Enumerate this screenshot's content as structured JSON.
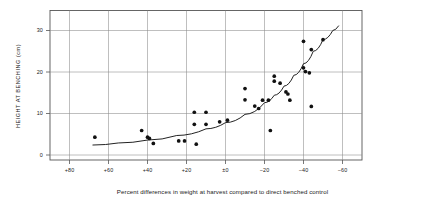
{
  "chart_data": {
    "type": "scatter",
    "title": "",
    "subtitle": "",
    "xlabel": "Percent differences in weight at harvest compared to direct benched control",
    "ylabel": "HEIGHT AT BENCHING (cm)",
    "grid": true,
    "legend": "none",
    "xlim": [
      90,
      -70
    ],
    "ylim": [
      -2.5,
      33
    ],
    "x_axis_inverted": true,
    "xticks": [
      80,
      60,
      40,
      20,
      0,
      -20,
      -40,
      -60
    ],
    "xtick_labels": [
      "+80",
      "+60",
      "+40",
      "+20",
      "±0",
      "−20",
      "−40",
      "−60"
    ],
    "yticks": [
      0,
      10,
      20,
      30
    ],
    "ytick_labels": [
      "0",
      "10",
      "20",
      "30"
    ],
    "point_color": "#111111",
    "line_color": "#222222",
    "grid_color": "#8a8a8a",
    "frame_color": "#555555",
    "points": [
      {
        "x": 67,
        "y": 4.3
      },
      {
        "x": 43,
        "y": 5.9
      },
      {
        "x": 40,
        "y": 4.3
      },
      {
        "x": 39,
        "y": 4.0
      },
      {
        "x": 37,
        "y": 2.8
      },
      {
        "x": 24,
        "y": 3.4
      },
      {
        "x": 21,
        "y": 3.4
      },
      {
        "x": 16,
        "y": 10.3
      },
      {
        "x": 16,
        "y": 7.4
      },
      {
        "x": 15,
        "y": 2.6
      },
      {
        "x": 10,
        "y": 10.3
      },
      {
        "x": 10,
        "y": 7.4
      },
      {
        "x": 3,
        "y": 8.0
      },
      {
        "x": -1,
        "y": 8.4
      },
      {
        "x": -10,
        "y": 16.0
      },
      {
        "x": -10,
        "y": 13.3
      },
      {
        "x": -15,
        "y": 11.8
      },
      {
        "x": -17,
        "y": 11.2
      },
      {
        "x": -19,
        "y": 13.2
      },
      {
        "x": -22,
        "y": 13.2
      },
      {
        "x": -23,
        "y": 5.9
      },
      {
        "x": -25,
        "y": 19.0
      },
      {
        "x": -25,
        "y": 17.8
      },
      {
        "x": -28,
        "y": 17.3
      },
      {
        "x": -31,
        "y": 15.2
      },
      {
        "x": -32,
        "y": 14.7
      },
      {
        "x": -33,
        "y": 13.2
      },
      {
        "x": -40,
        "y": 27.4
      },
      {
        "x": -40,
        "y": 21.0
      },
      {
        "x": -41,
        "y": 20.1
      },
      {
        "x": -43,
        "y": 19.8
      },
      {
        "x": -44,
        "y": 11.7
      },
      {
        "x": -44,
        "y": 25.4
      },
      {
        "x": -50,
        "y": 27.8
      }
    ],
    "fit_curve": {
      "description": "fitted exponential-like trend line",
      "points": [
        {
          "x": 68,
          "y": 2.4
        },
        {
          "x": 55,
          "y": 2.9
        },
        {
          "x": 40,
          "y": 3.6
        },
        {
          "x": 25,
          "y": 4.7
        },
        {
          "x": 10,
          "y": 6.3
        },
        {
          "x": 0,
          "y": 7.8
        },
        {
          "x": -10,
          "y": 9.8
        },
        {
          "x": -20,
          "y": 12.6
        },
        {
          "x": -25,
          "y": 14.4
        },
        {
          "x": -30,
          "y": 16.6
        },
        {
          "x": -35,
          "y": 19.2
        },
        {
          "x": -40,
          "y": 22.0
        },
        {
          "x": -45,
          "y": 25.0
        },
        {
          "x": -50,
          "y": 27.8
        },
        {
          "x": -55,
          "y": 30.0
        },
        {
          "x": -58,
          "y": 31.1
        }
      ]
    }
  }
}
